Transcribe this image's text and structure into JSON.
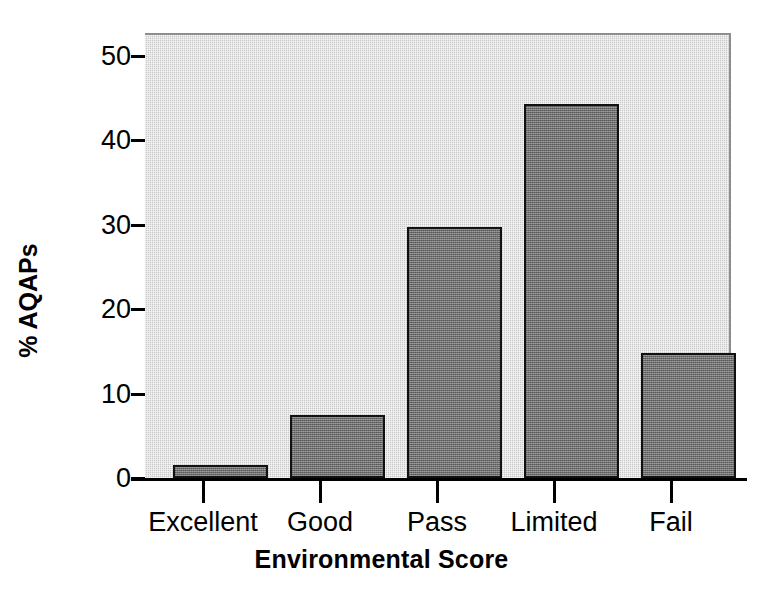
{
  "chart_data": {
    "type": "bar",
    "title": "",
    "subtitle": "",
    "xlabel": "Environmental Score",
    "ylabel": "% AQAPs",
    "categories": [
      "Excellent",
      "Good",
      "Pass",
      "Limited",
      "Fail"
    ],
    "values": [
      1.5,
      7.5,
      29.7,
      44.3,
      14.8
    ],
    "series": [
      {
        "name": "% AQAPs",
        "values": [
          1.5,
          7.5,
          29.7,
          44.3,
          14.8
        ]
      }
    ],
    "ylim": [
      0,
      52.5
    ],
    "xlim_note": "categorical",
    "yticks": [
      0,
      10,
      20,
      30,
      40,
      50
    ],
    "ytick_labels": [
      "0",
      "10",
      "20",
      "30",
      "40",
      "50"
    ],
    "grid": false,
    "legend": false,
    "legend_position": "none",
    "annotations": [],
    "colors": {
      "bar_fill": "#6f6f6f",
      "bar_edge": "#111111",
      "plot_background": "#c9c9c9",
      "figure_background": "#ffffff",
      "axis": "#000000",
      "text": "#000000"
    }
  },
  "axes": {
    "y_title": "% AQAPs",
    "x_title": "Environmental Score",
    "y_tick_labels": [
      "50",
      "40",
      "30",
      "20",
      "10",
      "0"
    ],
    "x_tick_labels": [
      "Excellent",
      "Good",
      "Pass",
      "Limited",
      "Fail"
    ]
  }
}
